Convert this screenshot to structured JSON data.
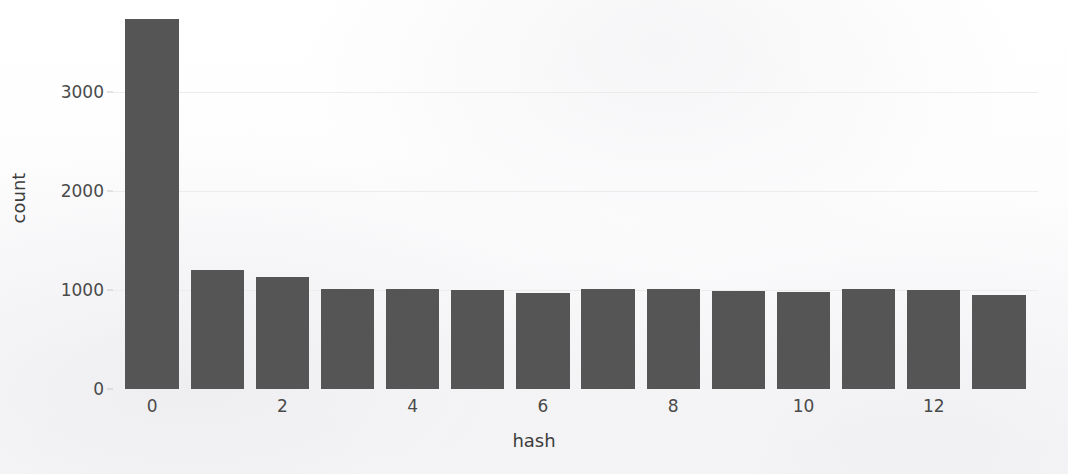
{
  "chart_data": {
    "type": "bar",
    "title": "",
    "xlabel": "hash",
    "ylabel": "count",
    "categories": [
      "0",
      "1",
      "2",
      "3",
      "4",
      "5",
      "6",
      "7",
      "8",
      "9",
      "10",
      "11",
      "12",
      "13"
    ],
    "values": [
      3740,
      1200,
      1135,
      1015,
      1015,
      1000,
      975,
      1015,
      1015,
      990,
      985,
      1010,
      1005,
      955
    ],
    "x_tick_labels": [
      "0",
      "2",
      "4",
      "6",
      "8",
      "10",
      "12"
    ],
    "x_tick_values": [
      0,
      2,
      4,
      6,
      8,
      10,
      12
    ],
    "y_tick_labels": [
      "0",
      "1000",
      "2000",
      "3000"
    ],
    "y_tick_values": [
      0,
      1000,
      2000,
      3000
    ],
    "ylim": [
      0,
      3850
    ],
    "xlim": [
      -0.6,
      13.6
    ],
    "grid": true,
    "grid_axis": "y",
    "legend": null,
    "bar_color": "#555555",
    "background_color": "#fdfdfd",
    "gridline_color": "#ececec"
  },
  "axes": {
    "y_axis_label": "count",
    "x_axis_label": "hash"
  }
}
